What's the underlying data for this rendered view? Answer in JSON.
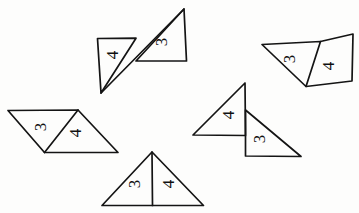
{
  "page": {
    "background_color": "#fdfdfc",
    "ink_color": "#141414",
    "width": 359,
    "height": 213
  },
  "figures": [
    {
      "id": "figure-top-left",
      "name": "bowtie-pair-top-left",
      "description": "Two triangles meeting at a single point forming a Z / bowtie arrangement",
      "triangles": [
        {
          "id": "tl-left-triangle",
          "label": "4",
          "label_rotation": -90,
          "label_x": 114,
          "label_y": 55,
          "points": "97,38 136,38 101,93"
        },
        {
          "id": "tl-right-triangle",
          "label": "3",
          "label_rotation": -90,
          "label_x": 163,
          "label_y": 42,
          "points": "184,9 186,61 136,61"
        }
      ],
      "connector": "101,93 184,9"
    },
    {
      "id": "figure-top-right",
      "name": "triangle-pair-top-right",
      "description": "Wide flat triangle joined along a slanted edge to an upright right triangle",
      "triangles": [
        {
          "id": "tr-left-triangle",
          "label": "3",
          "label_rotation": -90,
          "label_x": 291,
          "label_y": 59,
          "points": "262,44 320,41 306,86"
        },
        {
          "id": "tr-right-triangle",
          "label": "4",
          "label_rotation": -90,
          "label_x": 329,
          "label_y": 66,
          "points": "320,41 353,34 352,81 306,86"
        }
      ],
      "connector": ""
    },
    {
      "id": "figure-left",
      "name": "parallelogram-pair-left",
      "description": "Parallelogram divided by a diagonal into two congruent triangles",
      "triangles": [
        {
          "id": "l-left-triangle",
          "label": "3",
          "label_rotation": -90,
          "label_x": 42,
          "label_y": 127,
          "points": "8,110 78,110 44,152"
        },
        {
          "id": "l-right-triangle",
          "label": "4",
          "label_rotation": -90,
          "label_x": 77,
          "label_y": 133,
          "points": "78,110 118,152 44,152"
        }
      ],
      "connector": ""
    },
    {
      "id": "figure-middle-right",
      "name": "triangle-pair-middle-right",
      "description": "Two right triangles sharing a vertical edge, vertically offset",
      "triangles": [
        {
          "id": "mr-upper-triangle",
          "label": "4",
          "label_rotation": -90,
          "label_x": 230,
          "label_y": 115,
          "points": "245,83 245,135 193,135"
        },
        {
          "id": "mr-lower-triangle",
          "label": "3",
          "label_rotation": -90,
          "label_x": 261,
          "label_y": 139,
          "points": "245,110 245,156 301,156"
        }
      ],
      "connector": ""
    },
    {
      "id": "figure-bottom",
      "name": "triangle-pair-bottom",
      "description": "Large isosceles triangle split by a vertical median into two triangles",
      "triangles": [
        {
          "id": "b-left-triangle",
          "label": "3",
          "label_rotation": -90,
          "label_x": 136,
          "label_y": 184,
          "points": "152,152 152,205 102,205"
        },
        {
          "id": "b-right-triangle",
          "label": "4",
          "label_rotation": -90,
          "label_x": 170,
          "label_y": 184,
          "points": "152,152 203,205 152,205"
        }
      ],
      "connector": ""
    }
  ],
  "labels": {
    "three": "3",
    "four": "4"
  }
}
